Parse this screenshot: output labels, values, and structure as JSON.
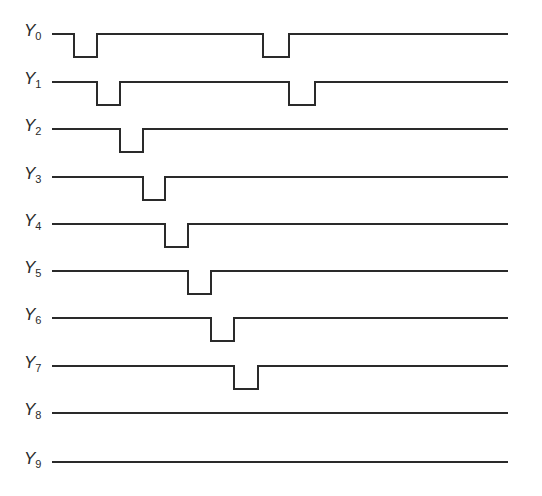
{
  "diagram": {
    "type": "timing-diagram",
    "line_color": "#2a2a2a",
    "background": "#ffffff",
    "x_start": 52,
    "x_end": 508,
    "pulse_depth": 23,
    "signals": [
      {
        "name": "Y",
        "sub": "0",
        "y": 34,
        "pulses": [
          [
            74,
            97
          ],
          [
            263,
            289
          ]
        ]
      },
      {
        "name": "Y",
        "sub": "1",
        "y": 82,
        "pulses": [
          [
            97,
            120
          ],
          [
            289,
            315
          ]
        ]
      },
      {
        "name": "Y",
        "sub": "2",
        "y": 129,
        "pulses": [
          [
            120,
            143
          ]
        ]
      },
      {
        "name": "Y",
        "sub": "3",
        "y": 177,
        "pulses": [
          [
            143,
            165
          ]
        ]
      },
      {
        "name": "Y",
        "sub": "4",
        "y": 224,
        "pulses": [
          [
            165,
            188
          ]
        ]
      },
      {
        "name": "Y",
        "sub": "5",
        "y": 271,
        "pulses": [
          [
            188,
            211
          ]
        ]
      },
      {
        "name": "Y",
        "sub": "6",
        "y": 318,
        "pulses": [
          [
            211,
            234
          ]
        ]
      },
      {
        "name": "Y",
        "sub": "7",
        "y": 366,
        "pulses": [
          [
            234,
            258
          ]
        ]
      },
      {
        "name": "Y",
        "sub": "8",
        "y": 413,
        "pulses": []
      },
      {
        "name": "Y",
        "sub": "9",
        "y": 462,
        "pulses": []
      }
    ]
  }
}
